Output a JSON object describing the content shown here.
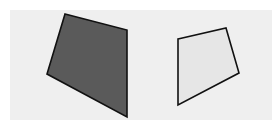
{
  "canvas": {
    "width": 279,
    "height": 130,
    "background": "#ffffff"
  },
  "panel": {
    "x": 10,
    "y": 10,
    "width": 262,
    "height": 110,
    "fill": "#efefef"
  },
  "shapes": [
    {
      "name": "dark-quadrilateral",
      "points": "65,14 127,30 127,117 47,74",
      "fill": "#5a5a5a",
      "stroke": "#111111",
      "stroke_width": 1.6
    },
    {
      "name": "light-quadrilateral",
      "points": "178,39 226,28 239,73 178,105",
      "fill": "#e6e6e6",
      "stroke": "#111111",
      "stroke_width": 1.6
    }
  ]
}
